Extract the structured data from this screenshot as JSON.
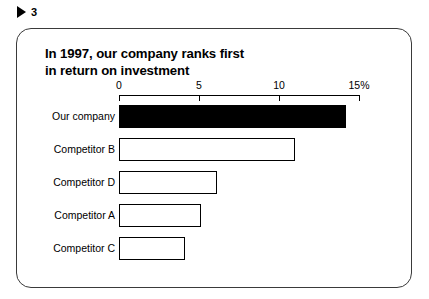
{
  "page_marker": {
    "icon": "play-triangle-icon",
    "number": "3"
  },
  "slide": {
    "title": "In 1997, our company ranks first\nin return on investment"
  },
  "chart_data": {
    "type": "bar",
    "orientation": "horizontal",
    "title": "In 1997, our company ranks first in return on investment",
    "xlabel": "",
    "ylabel": "",
    "xlim": [
      0,
      15
    ],
    "tick_labels": [
      "0",
      "5",
      "10",
      "15%"
    ],
    "tick_values": [
      0,
      5,
      10,
      15
    ],
    "grid": false,
    "legend": false,
    "categories": [
      "Our company",
      "Competitor B",
      "Competitor D",
      "Competitor A",
      "Competitor C"
    ],
    "values": [
      14.2,
      11.0,
      6.1,
      5.1,
      4.1
    ],
    "bar_styles": [
      "filled",
      "outline",
      "outline",
      "outline",
      "outline"
    ],
    "colors": {
      "highlight_bar": "#000000",
      "bar_outline": "#000000",
      "bar_fill": "#ffffff",
      "axis": "#000000",
      "frame_border": "#3a3a3a",
      "background": "#ffffff",
      "text": "#000000"
    }
  }
}
